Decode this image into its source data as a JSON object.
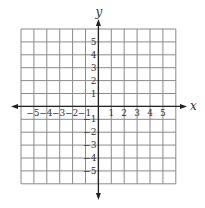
{
  "chart_data": {
    "type": "scatter",
    "title": "",
    "xlabel": "x",
    "ylabel": "y",
    "xlim": [
      -6,
      6
    ],
    "ylim": [
      -6,
      6
    ],
    "grid": true,
    "x_tick_labels": [
      "-5",
      "-4",
      "-3",
      "-2",
      "-1",
      "1",
      "2",
      "3",
      "4",
      "5"
    ],
    "y_tick_labels": [
      "5",
      "4",
      "3",
      "2",
      "1",
      "-1",
      "-2",
      "-3",
      "-4",
      "-5"
    ],
    "x_ticks": [
      -5,
      -4,
      -3,
      -2,
      -1,
      1,
      2,
      3,
      4,
      5
    ],
    "y_ticks": [
      5,
      4,
      3,
      2,
      1,
      -1,
      -2,
      -3,
      -4,
      -5
    ],
    "series": [],
    "legend": null
  },
  "colors": {
    "grid": "#8a8a8a",
    "axis": "#222222",
    "text": "#333333",
    "background": "#ffffff"
  }
}
